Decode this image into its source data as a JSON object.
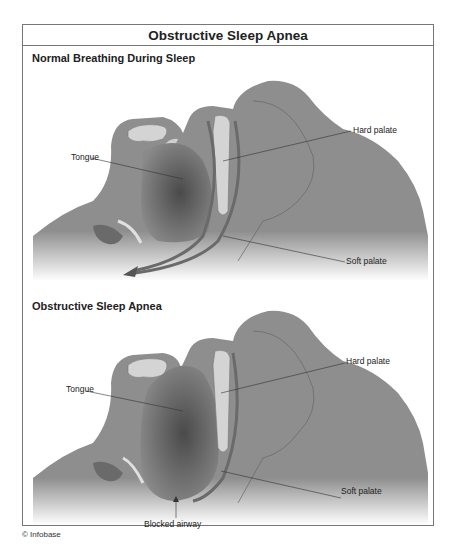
{
  "title": "Obstructive Sleep Apnea",
  "panels": [
    {
      "heading": "Normal Breathing During Sleep",
      "labels": {
        "tongue": "Tongue",
        "hard_palate": "Hard palate",
        "soft_palate": "Soft palate"
      }
    },
    {
      "heading": "Obstructive Sleep Apnea",
      "labels": {
        "tongue": "Tongue",
        "hard_palate": "Hard palate",
        "soft_palate": "Soft palate",
        "blocked_airway": "Blocked airway"
      }
    }
  ],
  "credit": "© Infobase",
  "colors": {
    "tissue": "#8e8e8e",
    "tissue_light": "#a8a8a8",
    "dark_cavity": "#555555",
    "bone": "#d4d4d4",
    "line": "#333333"
  }
}
